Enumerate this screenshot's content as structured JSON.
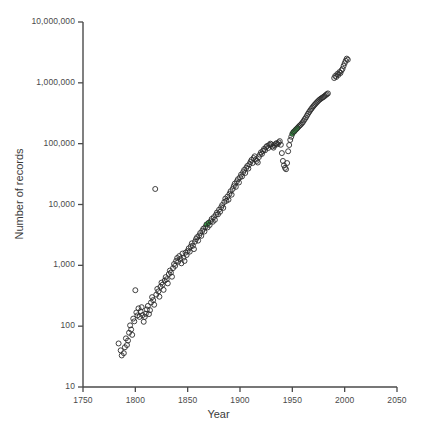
{
  "chart_data": {
    "type": "scatter",
    "title": "",
    "xlabel": "Year",
    "ylabel": "Number of records",
    "xlim": [
      1750,
      2050
    ],
    "ylim": [
      10,
      10000000
    ],
    "yscale": "log",
    "xticks": [
      1750,
      1800,
      1850,
      1900,
      1950,
      2000,
      2050
    ],
    "xticklabels": [
      "1750",
      "1800",
      "1850",
      "1900",
      "1950",
      "2000",
      "2050"
    ],
    "yticks": [
      10,
      100,
      1000,
      10000,
      100000,
      1000000,
      10000000
    ],
    "yticklabels": [
      "10",
      "100",
      "1,000",
      "10,000",
      "100,000",
      "1,000,000",
      "10,000,000"
    ],
    "grid": false,
    "legend": null,
    "marker": "open-circle",
    "marker_size": 5,
    "marker_edge_color": "#2b2b2b",
    "marker_face_color": "none",
    "highlight_face_color": "#3aa349",
    "series": [
      {
        "name": "records",
        "points": [
          [
            1784,
            52
          ],
          [
            1786,
            40
          ],
          [
            1787,
            33
          ],
          [
            1789,
            36
          ],
          [
            1790,
            45
          ],
          [
            1791,
            63
          ],
          [
            1792,
            49
          ],
          [
            1793,
            58
          ],
          [
            1794,
            78
          ],
          [
            1795,
            103
          ],
          [
            1796,
            88
          ],
          [
            1797,
            72
          ],
          [
            1798,
            133
          ],
          [
            1799,
            120
          ],
          [
            1800,
            390
          ],
          [
            1801,
            168
          ],
          [
            1802,
            150
          ],
          [
            1803,
            196
          ],
          [
            1804,
            142
          ],
          [
            1805,
            175
          ],
          [
            1806,
            205
          ],
          [
            1807,
            152
          ],
          [
            1808,
            118
          ],
          [
            1809,
            142
          ],
          [
            1810,
            160
          ],
          [
            1811,
            188
          ],
          [
            1812,
            215
          ],
          [
            1813,
            158
          ],
          [
            1814,
            183
          ],
          [
            1815,
            245
          ],
          [
            1816,
            300
          ],
          [
            1817,
            268
          ],
          [
            1818,
            225
          ],
          [
            1819,
            18000
          ],
          [
            1820,
            330
          ],
          [
            1821,
            410
          ],
          [
            1822,
            372
          ],
          [
            1823,
            305
          ],
          [
            1824,
            445
          ],
          [
            1825,
            520
          ],
          [
            1826,
            480
          ],
          [
            1827,
            395
          ],
          [
            1828,
            560
          ],
          [
            1829,
            640
          ],
          [
            1830,
            590
          ],
          [
            1831,
            505
          ],
          [
            1832,
            720
          ],
          [
            1833,
            820
          ],
          [
            1834,
            760
          ],
          [
            1835,
            650
          ],
          [
            1836,
            900
          ],
          [
            1837,
            1050
          ],
          [
            1838,
            980
          ],
          [
            1839,
            1180
          ],
          [
            1840,
            1320
          ],
          [
            1841,
            1150
          ],
          [
            1842,
            1420
          ],
          [
            1843,
            1280
          ],
          [
            1844,
            1080
          ],
          [
            1845,
            1560
          ],
          [
            1846,
            1340
          ],
          [
            1847,
            1180
          ],
          [
            1848,
            1620
          ],
          [
            1849,
            1480
          ],
          [
            1850,
            1720
          ],
          [
            1851,
            1900
          ],
          [
            1852,
            1680
          ],
          [
            1853,
            2050
          ],
          [
            1854,
            2300
          ],
          [
            1855,
            2100
          ],
          [
            1856,
            1850
          ],
          [
            1857,
            2450
          ],
          [
            1858,
            2700
          ],
          [
            1859,
            2900
          ],
          [
            1860,
            2550
          ],
          [
            1861,
            3100
          ],
          [
            1862,
            3400
          ],
          [
            1863,
            3050
          ],
          [
            1864,
            3700
          ],
          [
            1865,
            4000
          ],
          [
            1866,
            3600
          ],
          [
            1867,
            4300
          ],
          [
            1868,
            4700
          ],
          [
            1869,
            4200
          ],
          [
            1870,
            5000
          ],
          [
            1871,
            4600
          ],
          [
            1872,
            5300
          ],
          [
            1873,
            5800
          ],
          [
            1874,
            5200
          ],
          [
            1875,
            6200
          ],
          [
            1876,
            5600
          ],
          [
            1877,
            6800
          ],
          [
            1878,
            7400
          ],
          [
            1879,
            6900
          ],
          [
            1880,
            8200
          ],
          [
            1881,
            7600
          ],
          [
            1882,
            9000
          ],
          [
            1883,
            9800
          ],
          [
            1884,
            8800
          ],
          [
            1885,
            11000
          ],
          [
            1886,
            12500
          ],
          [
            1887,
            11500
          ],
          [
            1888,
            13500
          ],
          [
            1889,
            12000
          ],
          [
            1890,
            15000
          ],
          [
            1891,
            16500
          ],
          [
            1892,
            14500
          ],
          [
            1893,
            18000
          ],
          [
            1894,
            20000
          ],
          [
            1895,
            22000
          ],
          [
            1896,
            19500
          ],
          [
            1897,
            24000
          ],
          [
            1898,
            26000
          ],
          [
            1899,
            23000
          ],
          [
            1900,
            28000
          ],
          [
            1901,
            31000
          ],
          [
            1902,
            29000
          ],
          [
            1903,
            34000
          ],
          [
            1904,
            37000
          ],
          [
            1905,
            33000
          ],
          [
            1906,
            40000
          ],
          [
            1907,
            43000
          ],
          [
            1908,
            39000
          ],
          [
            1909,
            46000
          ],
          [
            1910,
            50000
          ],
          [
            1911,
            54000
          ],
          [
            1912,
            48000
          ],
          [
            1913,
            58000
          ],
          [
            1914,
            62000
          ],
          [
            1915,
            55000
          ],
          [
            1916,
            52000
          ],
          [
            1917,
            49000
          ],
          [
            1918,
            60000
          ],
          [
            1919,
            66000
          ],
          [
            1920,
            72000
          ],
          [
            1921,
            68000
          ],
          [
            1922,
            76000
          ],
          [
            1923,
            82000
          ],
          [
            1924,
            78000
          ],
          [
            1925,
            88000
          ],
          [
            1926,
            92000
          ],
          [
            1927,
            85000
          ],
          [
            1928,
            95000
          ],
          [
            1929,
            100000
          ],
          [
            1930,
            97000
          ],
          [
            1931,
            90000
          ],
          [
            1932,
            86000
          ],
          [
            1933,
            93000
          ],
          [
            1934,
            99000
          ],
          [
            1935,
            102000
          ],
          [
            1936,
            98000
          ],
          [
            1937,
            105000
          ],
          [
            1938,
            110000
          ],
          [
            1939,
            96000
          ],
          [
            1940,
            70000
          ],
          [
            1941,
            52000
          ],
          [
            1942,
            44000
          ],
          [
            1943,
            40000
          ],
          [
            1944,
            38000
          ],
          [
            1945,
            48000
          ],
          [
            1946,
            75000
          ],
          [
            1947,
            95000
          ],
          [
            1948,
            115000
          ],
          [
            1949,
            130000
          ],
          [
            1950,
            145000
          ],
          [
            1951,
            155000
          ],
          [
            1952,
            160000
          ],
          [
            1953,
            168000
          ],
          [
            1954,
            175000
          ],
          [
            1955,
            182000
          ],
          [
            1956,
            190000
          ],
          [
            1957,
            198000
          ],
          [
            1958,
            205000
          ],
          [
            1959,
            215000
          ],
          [
            1960,
            225000
          ],
          [
            1961,
            240000
          ],
          [
            1962,
            255000
          ],
          [
            1963,
            270000
          ],
          [
            1964,
            290000
          ],
          [
            1965,
            310000
          ],
          [
            1966,
            330000
          ],
          [
            1967,
            350000
          ],
          [
            1968,
            370000
          ],
          [
            1969,
            390000
          ],
          [
            1970,
            410000
          ],
          [
            1971,
            430000
          ],
          [
            1972,
            450000
          ],
          [
            1973,
            470000
          ],
          [
            1974,
            490000
          ],
          [
            1975,
            510000
          ],
          [
            1976,
            530000
          ],
          [
            1977,
            545000
          ],
          [
            1978,
            560000
          ],
          [
            1979,
            575000
          ],
          [
            1980,
            590000
          ],
          [
            1981,
            610000
          ],
          [
            1982,
            630000
          ],
          [
            1983,
            650000
          ],
          [
            1984,
            670000
          ],
          [
            1990,
            1200000
          ],
          [
            1991,
            1300000
          ],
          [
            1992,
            1250000
          ],
          [
            1993,
            1400000
          ],
          [
            1994,
            1350000
          ],
          [
            1995,
            1500000
          ],
          [
            1996,
            1450000
          ],
          [
            1997,
            1600000
          ],
          [
            1998,
            1700000
          ],
          [
            1999,
            1900000
          ],
          [
            2000,
            2100000
          ],
          [
            2001,
            2300000
          ],
          [
            2002,
            2500000
          ],
          [
            2003,
            2400000
          ]
        ],
        "highlighted_points": [
          [
            1868,
            4700
          ],
          [
            1870,
            5000
          ],
          [
            1950,
            145000
          ],
          [
            1951,
            155000
          ],
          [
            1952,
            160000
          ],
          [
            1953,
            168000
          ],
          [
            1954,
            175000
          ],
          [
            1955,
            182000
          ]
        ]
      }
    ]
  },
  "axis": {
    "spine_color": "#4a4a4a",
    "tick_color": "#4a4a4a"
  }
}
